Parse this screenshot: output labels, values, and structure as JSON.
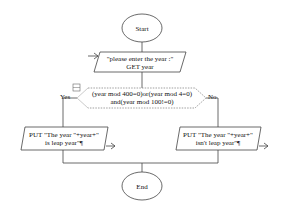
{
  "flowchart": {
    "start": {
      "label": "Start"
    },
    "input": {
      "line1": "\"please enter the year :\"",
      "line2": "GET year"
    },
    "decision": {
      "line1": "(year mod 400=0)or(year mod 4=0)",
      "line2": "and(year mod 100!=0)",
      "yes_label": "Yes",
      "no_label": "No"
    },
    "output_yes": {
      "line1": "PUT \"The year \"+year+\"",
      "line2": "is leap year\"¶"
    },
    "output_no": {
      "line1": "PUT \"The year \"+year+\"",
      "line2": "isn't leap year\"¶"
    },
    "end": {
      "label": "End"
    }
  }
}
